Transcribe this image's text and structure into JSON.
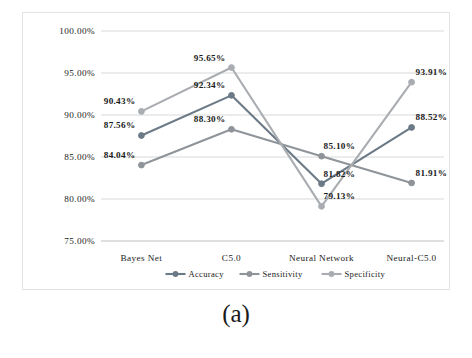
{
  "figure": {
    "caption": "(a)"
  },
  "chart_data": {
    "type": "line",
    "title": "",
    "xlabel": "",
    "ylabel": "",
    "ylim": [
      75,
      100
    ],
    "ytick_step": 5,
    "grid": true,
    "legend_position": "bottom",
    "categories": [
      "Bayes Net",
      "C5.0",
      "Neural Network",
      "Neural-C5.0"
    ],
    "ytick_labels": [
      "100.00%",
      "95.00%",
      "90.00%",
      "85.00%",
      "80.00%",
      "75.00%"
    ],
    "ytick_values": [
      100,
      95,
      90,
      85,
      80,
      75
    ],
    "series": [
      {
        "name": "Accuracy",
        "color": "#6b7a86",
        "values": [
          87.56,
          92.34,
          81.82,
          88.52
        ],
        "labels": [
          "87.56%",
          "92.34%",
          "81.82%",
          "88.52%"
        ]
      },
      {
        "name": "Sensitivity",
        "color": "#8e9499",
        "values": [
          84.04,
          88.3,
          85.1,
          81.91
        ],
        "labels": [
          "84.04%",
          "88.30%",
          "85.10%",
          "81.91%"
        ]
      },
      {
        "name": "Specificity",
        "color": "#a9adb1",
        "values": [
          90.43,
          95.65,
          79.13,
          93.91
        ],
        "labels": [
          "90.43%",
          "95.65%",
          "79.13%",
          "93.91%"
        ]
      }
    ]
  }
}
